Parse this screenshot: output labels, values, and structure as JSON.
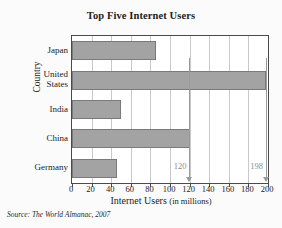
{
  "figure": {
    "background_color": "#fbfbfb",
    "plot_background_color": "#ffffff",
    "bar_color": "#a3a3a3",
    "bar_border_color": "#7a7a7a",
    "gridline_color": "#c9c9c9",
    "axis_color": "#4a4a4a",
    "annotation_color": "#8d8d8d"
  },
  "source_note": "Source: The World Almanac, 2007",
  "chart_data": {
    "type": "bar",
    "orientation": "horizontal",
    "title": "Top Five Internet Users",
    "xlabel": "Internet Users",
    "xlabel_sub": "(in millions)",
    "ylabel": "Country",
    "categories": [
      "Japan",
      "United States",
      "India",
      "China",
      "Germany"
    ],
    "values": [
      86,
      198,
      50,
      120,
      46
    ],
    "xlim": [
      0,
      200
    ],
    "xticks": [
      0,
      20,
      40,
      60,
      80,
      100,
      120,
      140,
      160,
      180,
      200
    ],
    "xtick_labels": [
      "0",
      "20",
      "40",
      "60",
      "80",
      "100",
      "120",
      "140",
      "160",
      "180",
      "200"
    ],
    "grid": "vertical",
    "legend": "none",
    "annotations": [
      {
        "label": "120",
        "value": 120,
        "series": "China"
      },
      {
        "label": "198",
        "value": 198,
        "series": "United States"
      }
    ]
  }
}
